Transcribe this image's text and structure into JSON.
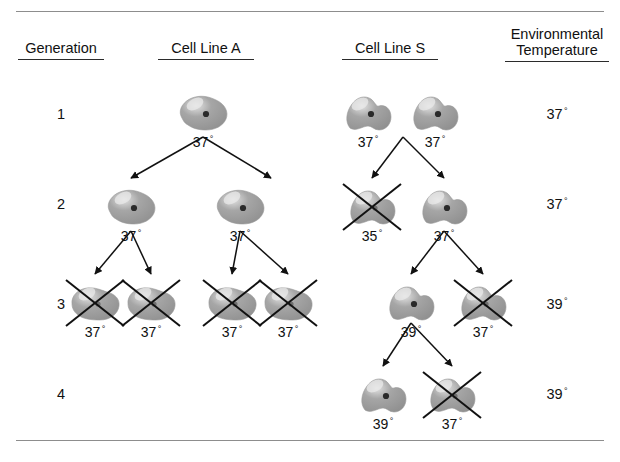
{
  "figure": {
    "columns": [
      {
        "id": "generation",
        "label": "Generation",
        "x": 18,
        "y": 40,
        "width": 86
      },
      {
        "id": "cell-line-a",
        "label": "Cell Line A",
        "x": 158,
        "y": 40,
        "width": 96
      },
      {
        "id": "cell-line-s",
        "label": "Cell Line S",
        "x": 342,
        "y": 40,
        "width": 96
      },
      {
        "id": "env-temp",
        "label": "Environmental\nTemperature",
        "x": 505,
        "y": 26,
        "width": 104
      }
    ],
    "generations": [
      {
        "number": "1",
        "y": 106,
        "env_temp": "37",
        "env_y": 106
      },
      {
        "number": "2",
        "y": 196,
        "env_temp": "37",
        "env_y": 196
      },
      {
        "number": "3",
        "y": 296,
        "env_temp": "39",
        "env_y": 296
      },
      {
        "number": "4",
        "y": 386,
        "env_temp": "39",
        "env_y": 386
      }
    ],
    "cells": [
      {
        "id": "a-g1-c1",
        "line": "A",
        "generation": 1,
        "temp": "37",
        "dead": false,
        "shape": 1,
        "x": 175,
        "y": 92
      },
      {
        "id": "a-g2-c1",
        "line": "A",
        "generation": 2,
        "temp": "37",
        "dead": false,
        "shape": 1,
        "x": 103,
        "y": 186
      },
      {
        "id": "a-g2-c2",
        "line": "A",
        "generation": 2,
        "temp": "37",
        "dead": false,
        "shape": 1,
        "x": 212,
        "y": 186
      },
      {
        "id": "a-g3-c1",
        "line": "A",
        "generation": 3,
        "temp": "37",
        "dead": true,
        "shape": 2,
        "x": 67,
        "y": 282
      },
      {
        "id": "a-g3-c2",
        "line": "A",
        "generation": 3,
        "temp": "37",
        "dead": true,
        "shape": 2,
        "x": 123,
        "y": 282
      },
      {
        "id": "a-g3-c3",
        "line": "A",
        "generation": 3,
        "temp": "37",
        "dead": true,
        "shape": 2,
        "x": 204,
        "y": 282
      },
      {
        "id": "a-g3-c4",
        "line": "A",
        "generation": 3,
        "temp": "37",
        "dead": true,
        "shape": 2,
        "x": 260,
        "y": 282
      },
      {
        "id": "s-g1-c1",
        "line": "S",
        "generation": 1,
        "temp": "37",
        "dead": false,
        "shape": 3,
        "x": 340,
        "y": 92
      },
      {
        "id": "s-g1-c2",
        "line": "S",
        "generation": 1,
        "temp": "37",
        "dead": false,
        "shape": 3,
        "x": 407,
        "y": 92
      },
      {
        "id": "s-g2-c1",
        "line": "S",
        "generation": 2,
        "temp": "35",
        "dead": true,
        "shape": 3,
        "x": 344,
        "y": 186
      },
      {
        "id": "s-g2-c2",
        "line": "S",
        "generation": 2,
        "temp": "37",
        "dead": false,
        "shape": 3,
        "x": 416,
        "y": 186
      },
      {
        "id": "s-g3-c1",
        "line": "S",
        "generation": 3,
        "temp": "39",
        "dead": false,
        "shape": 3,
        "x": 383,
        "y": 282
      },
      {
        "id": "s-g3-c2",
        "line": "S",
        "generation": 3,
        "temp": "37",
        "dead": true,
        "shape": 3,
        "x": 455,
        "y": 282
      },
      {
        "id": "s-g4-c1",
        "line": "S",
        "generation": 4,
        "temp": "39",
        "dead": false,
        "shape": 3,
        "x": 355,
        "y": 374
      },
      {
        "id": "s-g4-c2",
        "line": "S",
        "generation": 4,
        "temp": "37",
        "dead": true,
        "shape": 3,
        "x": 424,
        "y": 374
      }
    ],
    "division_arrows": [
      {
        "id": "a-g1-to-g2",
        "apex_x": 203,
        "apex_y": 137,
        "targets": [
          [
            131,
            178
          ],
          [
            271,
            178
          ]
        ]
      },
      {
        "id": "a-g2-left-to-g3",
        "apex_x": 131,
        "apex_y": 231,
        "targets": [
          [
            95,
            274
          ],
          [
            151,
            274
          ]
        ]
      },
      {
        "id": "a-g2-right-to-g3",
        "apex_x": 240,
        "apex_y": 231,
        "targets": [
          [
            232,
            274
          ],
          [
            288,
            274
          ]
        ]
      },
      {
        "id": "s-g1-to-g2",
        "apex_x": 403,
        "apex_y": 137,
        "targets": [
          [
            372,
            178
          ],
          [
            444,
            178
          ]
        ]
      },
      {
        "id": "s-g2-to-g3",
        "apex_x": 444,
        "apex_y": 231,
        "targets": [
          [
            411,
            274
          ],
          [
            483,
            274
          ]
        ]
      },
      {
        "id": "s-g3-to-g4",
        "apex_x": 411,
        "apex_y": 323,
        "targets": [
          [
            383,
            366
          ],
          [
            452,
            366
          ]
        ]
      }
    ],
    "colors": {
      "cell_fill": "#a6a6a6",
      "cell_fill_dark": "#8f8f8f",
      "cell_highlight": "#e2e2e2",
      "nucleus": "#2a2a2a",
      "stroke": "#1a1a1a",
      "rule": "#8d8d8d"
    },
    "degree_symbol": "°"
  }
}
